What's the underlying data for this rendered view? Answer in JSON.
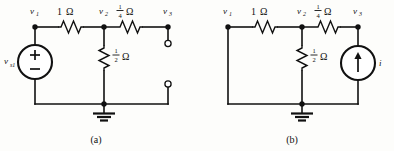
{
  "figure": {
    "kind": "circuit-diagram-pair",
    "background_color": "#fdfdfb",
    "line_color": "#111111"
  },
  "circuit_a": {
    "caption": "(a)",
    "nodes": [
      {
        "id": "v1",
        "label": "v",
        "subscript": "1"
      },
      {
        "id": "v2",
        "label": "v",
        "subscript": "2"
      },
      {
        "id": "v3",
        "label": "v",
        "subscript": "3"
      }
    ],
    "source": {
      "type": "voltage-source",
      "label": "v",
      "subscript": "s1",
      "plus": "+",
      "minus": "−"
    },
    "resistors": [
      {
        "id": "r-top-left",
        "orientation": "horizontal",
        "value": "1",
        "unit": "Ω",
        "fraction": false
      },
      {
        "id": "r-top-right",
        "orientation": "horizontal",
        "numerator": "1",
        "denominator": "4",
        "unit": "Ω",
        "fraction": true
      },
      {
        "id": "r-shunt",
        "orientation": "vertical",
        "numerator": "1",
        "denominator": "2",
        "unit": "Ω",
        "fraction": true
      }
    ],
    "terminals": [
      {
        "id": "term-top",
        "type": "open-terminal"
      },
      {
        "id": "term-bottom",
        "type": "open-terminal"
      }
    ],
    "ground": {
      "type": "earth-ground"
    }
  },
  "circuit_b": {
    "caption": "(b)",
    "nodes": [
      {
        "id": "v1",
        "label": "v",
        "subscript": "1"
      },
      {
        "id": "v2",
        "label": "v",
        "subscript": "2"
      },
      {
        "id": "v3",
        "label": "v",
        "subscript": "3"
      }
    ],
    "source": {
      "type": "current-source",
      "label": "i",
      "direction": "up"
    },
    "resistors": [
      {
        "id": "r-top-left",
        "orientation": "horizontal",
        "value": "1",
        "unit": "Ω",
        "fraction": false
      },
      {
        "id": "r-top-right",
        "orientation": "horizontal",
        "numerator": "1",
        "denominator": "4",
        "unit": "Ω",
        "fraction": true
      },
      {
        "id": "r-shunt",
        "orientation": "vertical",
        "numerator": "1",
        "denominator": "2",
        "unit": "Ω",
        "fraction": true
      }
    ],
    "ground": {
      "type": "earth-ground"
    }
  }
}
